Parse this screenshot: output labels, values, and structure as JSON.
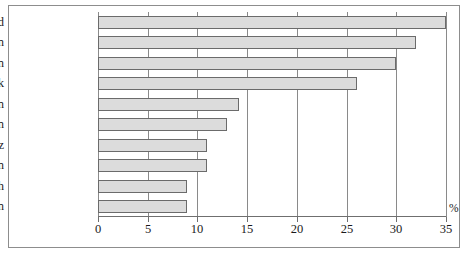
{
  "chart_data": {
    "type": "bar",
    "orientation": "horizontal",
    "title": "",
    "subtitle": "",
    "xlabel": "%",
    "ylabel": "",
    "unit": "%",
    "xlim": [
      0,
      35
    ],
    "xticks": [
      0,
      5,
      10,
      15,
      20,
      25,
      30,
      35
    ],
    "xtick_labels": [
      "0",
      "5",
      "10",
      "15",
      "20",
      "25",
      "30",
      "35"
    ],
    "grid": true,
    "grid_axis": "x",
    "legend": false,
    "legend_position": "none",
    "categories": [
      "Finnland",
      "Norwegen",
      "Schweden",
      "Dänemark",
      "Italien",
      "Großbritannien",
      "Schweiz",
      "Zypern",
      "Österreich",
      "Spanien"
    ],
    "values": [
      35,
      32,
      30,
      26,
      14.2,
      13,
      11,
      11,
      9,
      9
    ],
    "bar_fill_color": "#dcdcdc",
    "bar_border_color": "#6b6b6b",
    "axis_color": "#6f6f6f",
    "grid_color": "#8a8a8a",
    "text_color": "#1a1a1a",
    "background_color": "#ffffff",
    "frame_border_color": "#8d8d8d"
  }
}
